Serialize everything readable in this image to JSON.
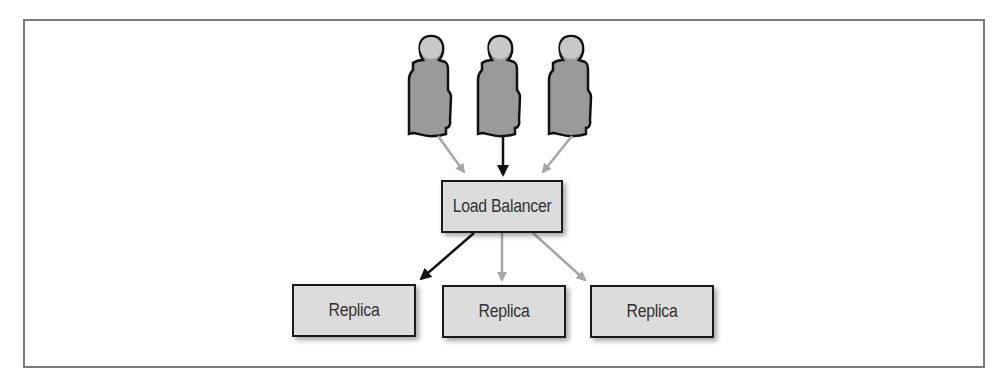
{
  "diagram": {
    "users": [
      {
        "id": "user-1",
        "icon": "person-icon"
      },
      {
        "id": "user-2",
        "icon": "person-icon"
      },
      {
        "id": "user-3",
        "icon": "person-icon"
      }
    ],
    "load_balancer": {
      "label": "Load Balancer"
    },
    "replicas": [
      {
        "label": "Replica"
      },
      {
        "label": "Replica"
      },
      {
        "label": "Replica"
      }
    ],
    "edges": [
      {
        "from": "user-1",
        "to": "load_balancer",
        "color": "#a6a6a6"
      },
      {
        "from": "user-2",
        "to": "load_balancer",
        "color": "#111111"
      },
      {
        "from": "user-3",
        "to": "load_balancer",
        "color": "#a6a6a6"
      },
      {
        "from": "load_balancer",
        "to": "replica-1",
        "color": "#111111"
      },
      {
        "from": "load_balancer",
        "to": "replica-2",
        "color": "#a6a6a6"
      },
      {
        "from": "load_balancer",
        "to": "replica-3",
        "color": "#a6a6a6"
      }
    ],
    "colors": {
      "node_fill": "#dcdcdc",
      "node_border": "#1a1a1a",
      "person_fill": "#9a9a9a",
      "person_head": "#c8c8c8",
      "active_edge": "#111111",
      "inactive_edge": "#a6a6a6",
      "frame": "#7a7a7a"
    }
  }
}
